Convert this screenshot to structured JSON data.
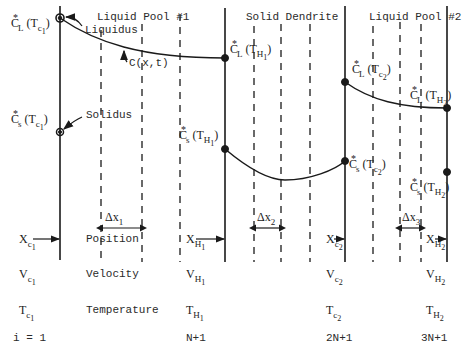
{
  "regions": {
    "liquid_pool_1": "Liquid Pool #1",
    "solid_dendrite": "Solid Dendrite",
    "liquid_pool_2": "Liquid Pool #2"
  },
  "curve_labels": {
    "liquidus": "Liquidus",
    "solidus": "Solidus",
    "concentration": "C(x,t)"
  },
  "point_labels": {
    "cl_tc1": {
      "base": "C",
      "sup": "*",
      "sub": "L",
      "arg": "(T",
      "arg_sub": "c",
      "arg_subsub": "1",
      "close": ")"
    },
    "cs_tc1": {
      "base": "C",
      "sup": "*",
      "sub": "s",
      "arg": "(T",
      "arg_sub": "c",
      "arg_subsub": "1",
      "close": ")"
    },
    "cl_th1": {
      "base": "C",
      "sup": "*",
      "sub": "L",
      "arg": "(T",
      "arg_sub": "H",
      "arg_subsub": "1",
      "close": ")"
    },
    "cs_th1": {
      "base": "C",
      "sup": "*",
      "sub": "s",
      "arg": "(T",
      "arg_sub": "H",
      "arg_subsub": "1",
      "close": ")"
    },
    "cl_tc2": {
      "base": "C",
      "sup": "*",
      "sub": "L",
      "arg": "(T",
      "arg_sub": "c",
      "arg_subsub": "2",
      "close": ")"
    },
    "cs_tc2": {
      "base": "C",
      "sup": "*",
      "sub": "s",
      "arg": "(T",
      "arg_sub": "c",
      "arg_subsub": "2",
      "close": ")"
    },
    "cl_th2": {
      "base": "C",
      "sup": "*",
      "sub": "L",
      "arg": "(T",
      "arg_sub": "H",
      "arg_subsub": "2",
      "close": ")"
    },
    "cs_th2": {
      "base": "C",
      "sup": "*",
      "sub": "s",
      "arg": "(T",
      "arg_sub": "H",
      "arg_subsub": "2",
      "close": ")"
    }
  },
  "spacing_labels": {
    "dx1": {
      "base": "Δx",
      "sub": "1"
    },
    "dx2": {
      "base": "Δx",
      "sub": "2"
    },
    "dx3": {
      "base": "Δx",
      "sub": "3"
    }
  },
  "row_labels": {
    "position": "Position",
    "velocity": "Velocity",
    "temperature": "Temperature"
  },
  "interfaces": [
    {
      "x": {
        "base": "X",
        "sub": "c",
        "subsub": "1"
      },
      "v": {
        "base": "V",
        "sub": "c",
        "subsub": "1"
      },
      "t": {
        "base": "T",
        "sub": "c",
        "subsub": "1"
      },
      "index": "i = 1"
    },
    {
      "x": {
        "base": "X",
        "sub": "H",
        "subsub": "1"
      },
      "v": {
        "base": "V",
        "sub": "H",
        "subsub": "1"
      },
      "t": {
        "base": "T",
        "sub": "H",
        "subsub": "1"
      },
      "index": "N+1"
    },
    {
      "x": {
        "base": "X",
        "sub": "c",
        "subsub": "2"
      },
      "v": {
        "base": "V",
        "sub": "c",
        "subsub": "2"
      },
      "t": {
        "base": "T",
        "sub": "c",
        "subsub": "2"
      },
      "index": "2N+1"
    },
    {
      "x": {
        "base": "X",
        "sub": "H",
        "subsub": "2"
      },
      "v": {
        "base": "V",
        "sub": "H",
        "subsub": "2"
      },
      "t": {
        "base": "T",
        "sub": "H",
        "subsub": "2"
      },
      "index": "3N+1"
    }
  ],
  "colors": {
    "ink": "#1a1a1a",
    "background": "#ffffff"
  }
}
